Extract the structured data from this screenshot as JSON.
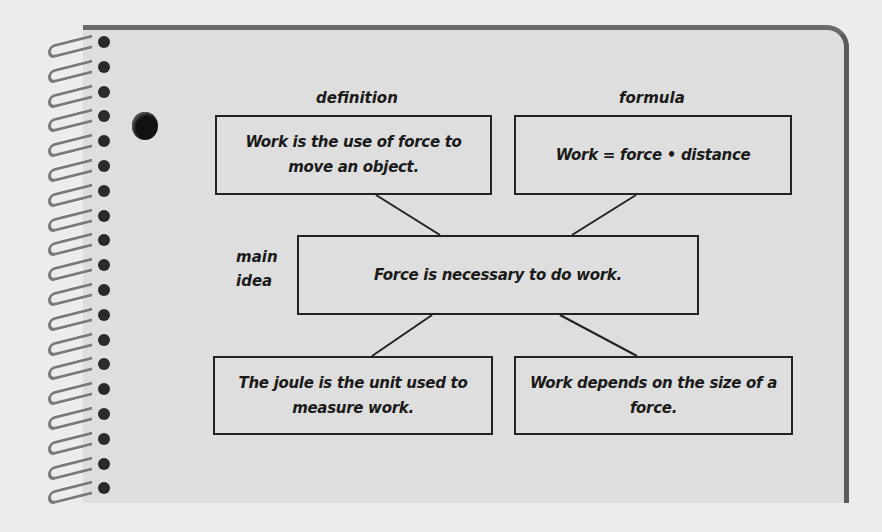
{
  "diagram": {
    "labels": {
      "definition": "definition",
      "formula": "formula",
      "main_idea_line1": "main",
      "main_idea_line2": "idea"
    },
    "boxes": {
      "definition": "Work is the use of force to move an object.",
      "formula": "Work = force • distance",
      "main_idea": "Force is necessary to do work.",
      "unit": "The joule is the unit used to measure work.",
      "detail": "Work depends on the size of a force."
    },
    "colors": {
      "page": "#dedede",
      "background": "#ececec",
      "ink": "#1a1a1a",
      "page_edge": "#5a5a5a"
    }
  }
}
